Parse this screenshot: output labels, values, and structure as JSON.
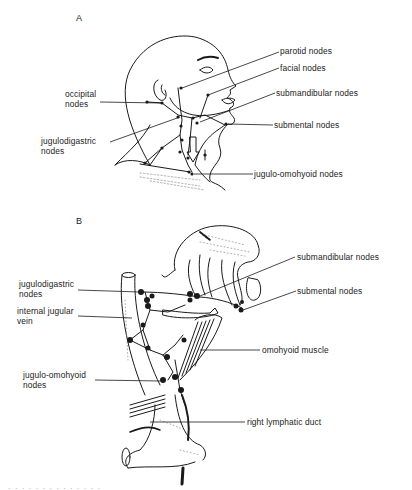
{
  "figure": {
    "panel_a": {
      "letter": "A",
      "labels": {
        "parotid": "parotid nodes",
        "facial": "facial nodes",
        "occipital": "occipital\nnodes",
        "submandibular": "submandibular nodes",
        "submental": "submental nodes",
        "jugulodigastric": "jugulodigastric\nnodes",
        "jugulo_omohyoid": "jugulo-omohyoid nodes"
      }
    },
    "panel_b": {
      "letter": "B",
      "labels": {
        "submandibular": "submandibular nodes",
        "jugulodigastric": "jugulodigastric\nnodes",
        "submental": "submental nodes",
        "internal_jugular_vein": "internal jugular\nvein",
        "omohyoid_muscle": "omohyoid muscle",
        "jugulo_omohyoid": "jugulo-omohyoid\nnodes",
        "right_lymphatic_duct": "right lymphatic duct"
      }
    },
    "caption_fragment": "· · · · · · · · · · · · · ·"
  },
  "colors": {
    "ink": "#1a1a1a",
    "stipple": "#9a9a9a"
  }
}
